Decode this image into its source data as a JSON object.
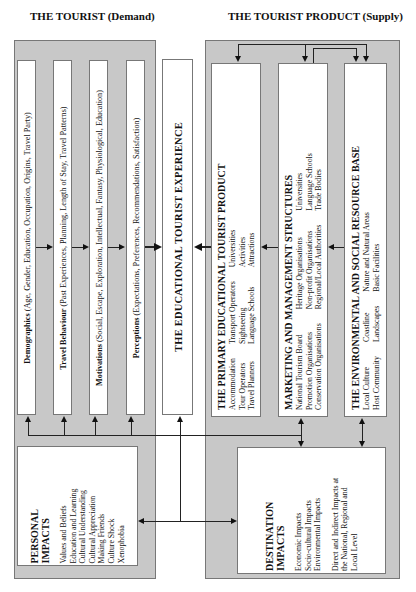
{
  "headings": {
    "demand": "THE TOURIST (Demand)",
    "supply": "THE TOURIST PRODUCT (Supply)"
  },
  "demand_columns": [
    {
      "label": "Demographics",
      "detail": " (Age, Gender, Education, Occupation, Origins, Travel Party)"
    },
    {
      "label": "Travel Behaviour",
      "detail": " (Past Experiences, Planning, Length of Stay, Travel Patterns)"
    },
    {
      "label": "Motivations",
      "detail": " (Social, Escape, Exploration, Intellectual, Fantasy, Physiological, Education)"
    },
    {
      "label": "Perceptions",
      "detail": " (Expectations, Preferences, Recommendations, Satisfaction)"
    }
  ],
  "center": {
    "title": "THE EDUCATIONAL TOURIST EXPERIENCE"
  },
  "supply_boxes": [
    {
      "title": "THE PRIMARY EDUCATIONAL TOURIST PRODUCT",
      "columns": [
        [
          "Accommodation",
          "Tour Operators",
          "Travel Planners"
        ],
        [
          "Transport Operators",
          "Sightseeing",
          "Language Schools"
        ],
        [
          "Universities",
          "Activities",
          "Attractions"
        ]
      ]
    },
    {
      "title": "MARKETING AND MANAGEMENT STRUCTURES",
      "columns": [
        [
          "National Tourism Board",
          "Promotion Organisations",
          "Conservation Organisations"
        ],
        [
          "Heritage Organisations",
          "Non-profit Organisations",
          "Regional/Local Authorities"
        ],
        [
          "Universities",
          "Language Schools",
          "Trade Bodies"
        ]
      ]
    },
    {
      "title": "THE ENVIRONMENTAL AND SOCIAL RESOURCE BASE",
      "columns": [
        [
          "Local Culture",
          "Host Community"
        ],
        [
          "Coastline",
          "Landscapes"
        ],
        [
          "Nature and Natural Areas",
          "Basic Facilities"
        ]
      ]
    }
  ],
  "personal_impacts": {
    "title_line1": "PERSONAL",
    "title_line2": "IMPACTS",
    "items": [
      "Values and Beliefs",
      "Education and Learning",
      "Cultural Understanding",
      "Cultural Appreciation",
      "Making Friends",
      "Culture Shock",
      "Xenophobia"
    ]
  },
  "destination_impacts": {
    "title_line1": "DESTINATION",
    "title_line2": "IMPACTS",
    "items": [
      "Economic Impacts",
      "Socio-cultural Impacts",
      "Environmental Impacts"
    ],
    "note": [
      "Direct and Indirect Impacts at",
      "the National, Regional and",
      "Local Level"
    ]
  },
  "colors": {
    "panel": "#c8c8c8",
    "box": "#ffffff",
    "line": "#222222"
  }
}
